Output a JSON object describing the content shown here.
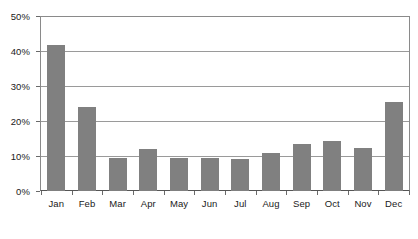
{
  "chart_data": {
    "type": "bar",
    "title": "",
    "subtitle": "",
    "xlabel": "",
    "ylabel": "",
    "categories": [
      "Jan",
      "Feb",
      "Mar",
      "Apr",
      "May",
      "Jun",
      "Jul",
      "Aug",
      "Sep",
      "Oct",
      "Nov",
      "Dec"
    ],
    "values": [
      42,
      24,
      9.5,
      12,
      9.5,
      9.5,
      9.3,
      11,
      13.5,
      14.5,
      12.5,
      25.5
    ],
    "ylim": [
      0,
      50
    ],
    "y_ticks": [
      0,
      10,
      20,
      30,
      40,
      50
    ],
    "y_tick_labels": [
      "0%",
      "10%",
      "20%",
      "30%",
      "40%",
      "50%"
    ],
    "grid": true,
    "grid_axis": "y",
    "legend": false,
    "legend_position": "none",
    "bar_color": "#808080",
    "gridline_color": "#9a9a9a",
    "axis_color": "#555555",
    "background_color": "#ffffff",
    "text_color": "#1a1a1a"
  }
}
